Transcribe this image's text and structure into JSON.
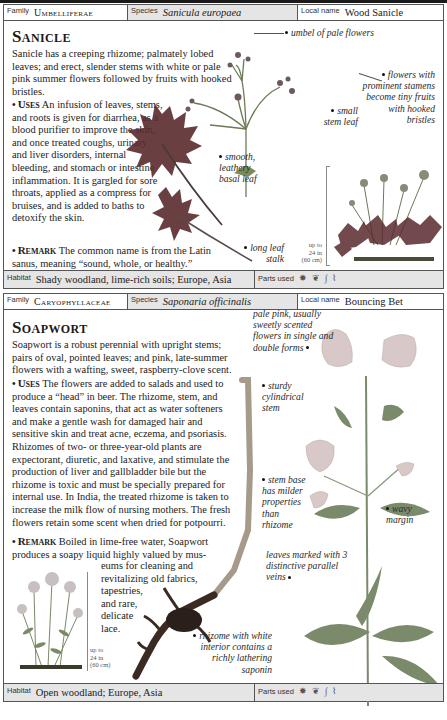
{
  "entries": [
    {
      "header": {
        "family_label": "Family",
        "family": "Umbelliferae",
        "species_label": "Species",
        "species": "Sanicula europaea",
        "local_label": "Local name",
        "local": "Wood Sanicle"
      },
      "title": "Sanicle",
      "intro": "Sanicle has a creeping rhizome; palmately lobed leaves; and erect, slender stems with white or pale pink summer flowers followed by fruits with hooked bristles.",
      "uses_label": "Uses",
      "uses": "An infusion of leaves, stems, and roots is given for diarrhea, as a blood purifier to improve the skin, and once treated coughs, urinary and liver disorders, internal bleeding, and stomach or intestine inflammation. It is gargled for sore throats, applied as a compress for bruises, and is added to baths to detoxify the skin.",
      "remark_label": "Remark",
      "remark": "The common name is from the Latin sanus, meaning “sound, whole, or healthy.”",
      "annotations": {
        "umbel": "umbel of pale flowers",
        "flowers": "flowers with prominent stamens become tiny fruits with hooked bristles",
        "small_leaf": "small stem leaf",
        "basal_leaf": "smooth, leathery basal leaf",
        "leaf_stalk": "long leaf stalk"
      },
      "scale": [
        "up to",
        "24 in",
        "(60 cm)"
      ],
      "footer": {
        "habitat_label": "Habitat",
        "habitat": "Shady woodland, lime-rich soils; Europe, Asia",
        "parts_label": "Parts used",
        "parts_icons": [
          "whole-plant-icon",
          "leaf-icon",
          "stem-icon",
          "root-icon"
        ]
      }
    },
    {
      "header": {
        "family_label": "Family",
        "family": "Caryophyllaceae",
        "species_label": "Species",
        "species": "Saponaria officinalis",
        "local_label": "Local name",
        "local": "Bouncing Bet"
      },
      "title": "Soapwort",
      "intro": "Soapwort is a robust perennial with upright stems; pairs of oval, pointed leaves; and pink, late-summer flowers with a wafting, sweet, raspberry-clove scent.",
      "uses_label": "Uses",
      "uses": "The flowers are added to salads and used to produce a “head” in beer. The rhizome, stem, and leaves contain saponins, that act as water softeners and make a gentle wash for damaged hair and sensitive skin and treat acne, eczema, and psoriasis. Rhizomes of two- or three-year-old plants are expectorant, diuretic, and laxative, and stimulate the production of liver and gallbladder bile but the rhizome is toxic and must be specially prepared for internal use. In India, the treated rhizome is taken to increase the milk flow of nursing mothers. The fresh flowers retain some scent when dried for potpourri.",
      "remark_label": "Remark",
      "remark_a": "Boiled in lime-free water, Soapwort produces a soapy liquid highly valued by mus-",
      "remark_b": [
        "eums for cleaning and",
        "revitalizing old fabrics,",
        "tapestries,",
        "and rare,",
        "delicate",
        "lace."
      ],
      "annotations": {
        "flowers": "pale pink, usually sweetly scented flowers in single and double forms",
        "stem": "sturdy cylindrical stem",
        "stem_base": "stem base has milder properties than rhizome",
        "margin": "wavy margin",
        "veins": "leaves marked with 3 distinctive parallel veins",
        "rhizome": "rhizome with white interior contains a richly lathering saponin"
      },
      "scale": [
        "up to",
        "24 in",
        "(60 cm)"
      ],
      "footer": {
        "habitat_label": "Habitat",
        "habitat": "Open woodland; Europe, Asia",
        "parts_label": "Parts used",
        "parts_icons": [
          "whole-plant-icon",
          "leaf-icon",
          "stem-icon",
          "root-icon"
        ]
      }
    }
  ],
  "colors": {
    "border": "#555555",
    "shaded_cell": "#e5e5e5",
    "leaf_dark": "#5a2a2e",
    "stem_green": "#6a7a55"
  }
}
